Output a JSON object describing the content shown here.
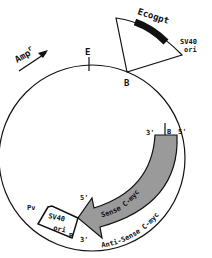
{
  "diagram": {
    "type": "plasmid-map",
    "labels": {
      "amp": "Amp",
      "amp_superscript": "r",
      "ecogpt": "Ecogpt",
      "sv40_ori_top_line1": "SV40",
      "sv40_ori_top_line2": "ori",
      "site_e": "E",
      "site_b_top": "B",
      "site_b_right": "B",
      "three_prime_right": "3'",
      "five_prime_right": "5'",
      "sense": "Sense C-myc",
      "antisense": "Anti-Sense C-myc",
      "five_prime_left": "5'",
      "three_prime_left": "3'",
      "site_pv": "Pv",
      "sv40_ori_bottom_line1": "SV40",
      "sv40_ori_bottom_line2": "ori",
      "site_b_bottom": "B"
    },
    "colors": {
      "line": "#111111",
      "insert_fill": "#9a9a9a",
      "ecogpt_fill": "#111111",
      "background": "#ffffff"
    }
  }
}
